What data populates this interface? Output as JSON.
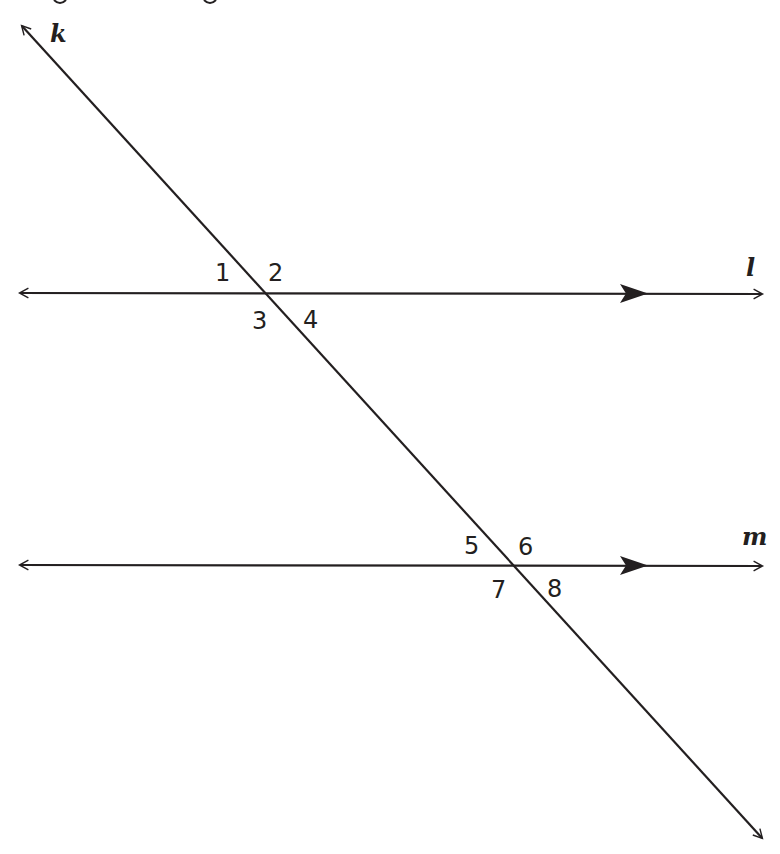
{
  "diagram": {
    "lines": {
      "k": {
        "label": "k",
        "role": "transversal"
      },
      "l": {
        "label": "l",
        "role": "parallel line"
      },
      "m": {
        "label": "m",
        "role": "parallel line"
      }
    },
    "angles": {
      "a1": "1",
      "a2": "2",
      "a3": "3",
      "a4": "4",
      "a5": "5",
      "a6": "6",
      "a7": "7",
      "a8": "8"
    },
    "parallel_marker": "single filled arrowhead on l and m",
    "colors": {
      "ink": "#231f20",
      "background": "#ffffff"
    }
  }
}
